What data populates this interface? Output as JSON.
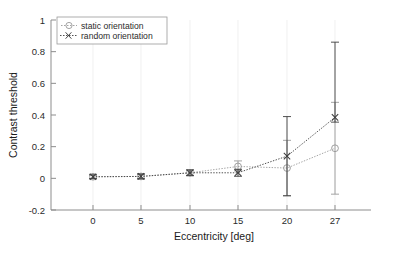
{
  "chart_data": {
    "type": "line",
    "title": "",
    "xlabel": "Eccentricity [deg]",
    "ylabel": "Contrast threshold",
    "x": [
      0,
      5,
      10,
      15,
      20,
      27
    ],
    "xtick_labels": [
      "0",
      "5",
      "10",
      "15",
      "20",
      "27"
    ],
    "ytick_labels": [
      "1",
      "0.8",
      "0.6",
      "0.4",
      "0.2",
      "0",
      "-0.2"
    ],
    "ytick_values": [
      1,
      0.8,
      0.6,
      0.4,
      0.2,
      0,
      -0.2
    ],
    "xlim": [
      -3,
      30
    ],
    "ylim": [
      -0.2,
      1
    ],
    "grid": false,
    "legend_position": "top-left",
    "series": [
      {
        "name": "static orientation",
        "marker": "circle",
        "linestyle": "dotted",
        "color": "#9a9a9a",
        "values": [
          0.01,
          0.012,
          0.035,
          0.075,
          0.065,
          0.19
        ],
        "err_low": [
          0.012,
          0.015,
          0.018,
          0.028,
          0.175,
          0.29
        ],
        "err_high": [
          0.012,
          0.015,
          0.018,
          0.035,
          0.175,
          0.29
        ]
      },
      {
        "name": "random orientation",
        "marker": "x",
        "linestyle": "dotted",
        "color": "#3d3d3d",
        "values": [
          0.01,
          0.012,
          0.035,
          0.035,
          0.14,
          0.385
        ],
        "err_low": [
          0.012,
          0.015,
          0.018,
          0.022,
          0.25,
          0.03
        ],
        "err_high": [
          0.012,
          0.015,
          0.018,
          0.022,
          0.25,
          0.475
        ]
      }
    ]
  },
  "axes": {
    "y_title": "Contrast threshold",
    "x_title": "Eccentricity [deg]"
  },
  "legend": {
    "entries": [
      {
        "label": "static orientation"
      },
      {
        "label": "random orientation"
      }
    ]
  },
  "colors": {
    "static": "#9a9a9a",
    "random": "#3d3d3d",
    "axis": "#8d8d8d",
    "text": "#2b2b2b",
    "background": "#ffffff"
  }
}
